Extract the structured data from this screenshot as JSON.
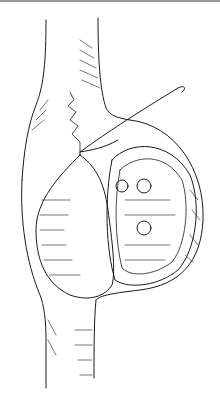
{
  "figure": {
    "kind": "surgical line illustration",
    "colors": {
      "ink": "#1a1a1a",
      "background": "#ffffff",
      "border": "#9a9a9a"
    }
  }
}
